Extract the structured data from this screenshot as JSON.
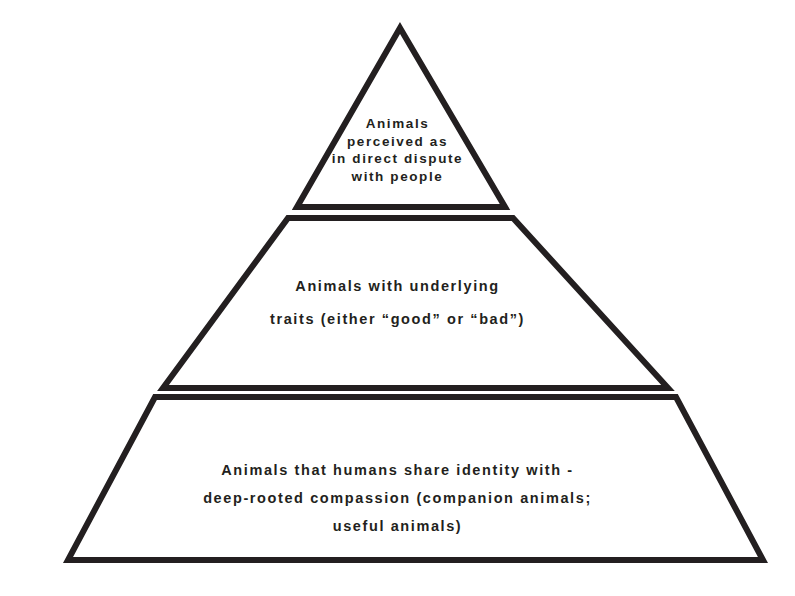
{
  "diagram": {
    "type": "pyramid",
    "orientation": "apex-up",
    "background_color": "#ffffff",
    "stroke_color": "#231f20",
    "text_color": "#231f20",
    "fill_color": "#ffffff",
    "tier_count": 3,
    "tiers": [
      {
        "id": "tier-1",
        "position": "top",
        "rank": 1,
        "shape": "triangle",
        "lines": [
          "Animals",
          "perceived as",
          "in direct dispute",
          "with people"
        ],
        "text": "Animals perceived as in direct dispute with people",
        "points": "400,28 505,207 297,207"
      },
      {
        "id": "tier-2",
        "position": "middle",
        "rank": 2,
        "shape": "trapezoid",
        "lines": [
          "Animals with underlying",
          "traits (either “good” or “bad”)"
        ],
        "text": "Animals with underlying traits (either “good” or “bad”)",
        "points": "288,218 513,218 668,388 163,388"
      },
      {
        "id": "tier-3",
        "position": "bottom",
        "rank": 3,
        "shape": "trapezoid",
        "lines": [
          "Animals that humans share identity with -",
          "deep-rooted compassion (companion animals;",
          "useful animals)"
        ],
        "text": "Animals that humans share identity with - deep-rooted compassion (companion animals; useful animals)",
        "points": "155,397 676,397 763,560 68,560"
      }
    ]
  }
}
